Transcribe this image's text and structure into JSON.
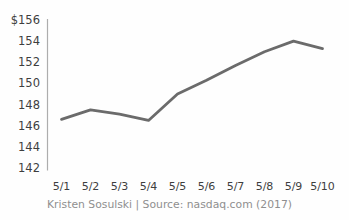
{
  "chart_data": {
    "type": "line",
    "title": "",
    "xlabel": "",
    "ylabel": "",
    "categories": [
      "5/1",
      "5/2",
      "5/3",
      "5/4",
      "5/5",
      "5/6",
      "5/7",
      "5/8",
      "5/9",
      "5/10"
    ],
    "values": [
      146.6,
      147.5,
      147.1,
      146.5,
      149.0,
      150.3,
      151.7,
      153.0,
      154.0,
      153.3
    ],
    "ylim": [
      142,
      156
    ],
    "y_ticks": [
      142,
      144,
      146,
      148,
      150,
      152,
      154,
      156
    ],
    "y_tick_labels": [
      "142",
      "144",
      "146",
      "148",
      "150",
      "152",
      "154",
      "$156"
    ],
    "grid": false,
    "legend": "none",
    "caption": "Kristen Sosulski | Source: nasdaq.com (2017)",
    "colors": {
      "line": "#6b6b6b",
      "axis": "#adadad",
      "tick_text": "#3e3e3e",
      "caption_text": "#8f8f8f",
      "background": "#fefefe"
    }
  }
}
